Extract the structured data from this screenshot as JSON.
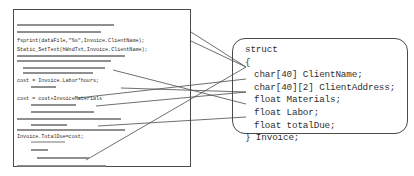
{
  "diagram": {
    "stroke_color": "#4a4a4a",
    "text_color": "#2b2b2b",
    "redaction_color": "#9a9a9a"
  },
  "code_panel": {
    "name": "source-code-listing",
    "legible_lines": [
      {
        "id": "fsprint",
        "text": "fsprint(dataFile,\"%s\",Invoice.ClientName);",
        "x": 3,
        "y": 28
      },
      {
        "id": "static-set",
        "text": "Static_SetText(hWndTxt,Invoice.ClientName);",
        "x": 3,
        "y": 37
      },
      {
        "id": "cost-labor",
        "text": "cost = Invoice.Labor*hours;",
        "x": 3,
        "y": 68
      },
      {
        "id": "cost-matls",
        "text": "cost = cost+InvoiceMaterials",
        "x": 3,
        "y": 86
      },
      {
        "id": "total-due",
        "text": "Invoice.TotalDue=cost;",
        "x": 3,
        "y": 124
      }
    ],
    "redacted_lines": [
      {
        "x": 3,
        "y": 14,
        "w": 97,
        "h": 2,
        "tone": "dark"
      },
      {
        "x": 3,
        "y": 21,
        "w": 84,
        "h": 2,
        "tone": "dark"
      },
      {
        "x": 3,
        "y": 45,
        "w": 108,
        "h": 2,
        "tone": "dark"
      },
      {
        "x": 3,
        "y": 50,
        "w": 94,
        "h": 2,
        "tone": "dark"
      },
      {
        "x": 9,
        "y": 57,
        "w": 82,
        "h": 2,
        "tone": "dark"
      },
      {
        "x": 9,
        "y": 62,
        "w": 70,
        "h": 2,
        "tone": "dark"
      },
      {
        "x": 17,
        "y": 76,
        "w": 25,
        "h": 2,
        "tone": "dark"
      },
      {
        "x": 17,
        "y": 94,
        "w": 45,
        "h": 2,
        "tone": "dark"
      },
      {
        "x": 17,
        "y": 101,
        "w": 63,
        "h": 2,
        "tone": "dark"
      },
      {
        "x": 3,
        "y": 108,
        "w": 104,
        "h": 2,
        "tone": "dark"
      },
      {
        "x": 17,
        "y": 114,
        "w": 36,
        "h": 2,
        "tone": "dark"
      },
      {
        "x": 3,
        "y": 119,
        "w": 108,
        "h": 2,
        "tone": "dark"
      },
      {
        "x": 17,
        "y": 131,
        "w": 34,
        "h": 2,
        "tone": "light"
      },
      {
        "x": 17,
        "y": 139,
        "w": 17,
        "h": 2,
        "tone": "dark"
      },
      {
        "x": 23,
        "y": 147,
        "w": 52,
        "h": 2,
        "tone": "dark"
      },
      {
        "x": 3,
        "y": 155,
        "w": 89,
        "h": 2,
        "tone": "dark"
      }
    ]
  },
  "struct_panel": {
    "name": "struct-definition",
    "lines": [
      {
        "id": "struct-keyword",
        "text": "struct",
        "indent": false
      },
      {
        "id": "open-brace",
        "text": "{",
        "indent": false
      },
      {
        "id": "client-name",
        "text": "char[40] ClientName;",
        "indent": true
      },
      {
        "id": "client-address",
        "text": "char[40][2] ClientAddress;",
        "indent": true
      },
      {
        "id": "materials",
        "text": "float Materials;",
        "indent": true
      },
      {
        "id": "labor",
        "text": "float Labor;",
        "indent": true
      },
      {
        "id": "total-due",
        "text": "float totalDue;",
        "indent": true
      },
      {
        "id": "close-brace",
        "text": "} Invoice;",
        "indent": false
      }
    ]
  },
  "connectors": [
    {
      "id": "fsprint-to-clientname",
      "from_label": "fsprint(dataFile,\"%s\",Invoice.ClientName);",
      "to_label": "char[40] ClientName;",
      "x1": 191,
      "y1": 32,
      "x2": 246,
      "y2": 67
    },
    {
      "id": "staticset-to-clientname",
      "from_label": "Static_SetText(hWndTxt,Invoice.ClientName);",
      "to_label": "char[40] ClientName;",
      "x1": 191,
      "y1": 41,
      "x2": 246,
      "y2": 67
    },
    {
      "id": "costlabor-to-labor",
      "from_label": "cost = Invoice.Labor*hours;",
      "to_label": "float Labor;",
      "x1": 113,
      "y1": 70,
      "x2": 246,
      "y2": 104
    },
    {
      "id": "costmatls-to-materials",
      "from_label": "cost = cost+InvoiceMaterials",
      "to_label": "float Materials;",
      "x1": 121,
      "y1": 88,
      "x2": 246,
      "y2": 92
    },
    {
      "id": "redacted-to-clientaddr",
      "from_label": "redacted source line",
      "to_label": "char[40][2] ClientAddress;",
      "x1": 78,
      "y1": 98,
      "x2": 246,
      "y2": 79
    },
    {
      "id": "redacted2-to-materials",
      "from_label": "redacted source line",
      "to_label": "float Materials;",
      "x1": 96,
      "y1": 106,
      "x2": 246,
      "y2": 92
    },
    {
      "id": "totaldue-to-totaldue",
      "from_label": "Invoice.TotalDue=cost;",
      "to_label": "float totalDue;",
      "x1": 98,
      "y1": 126,
      "x2": 246,
      "y2": 117
    },
    {
      "id": "bottom-to-clientname",
      "from_label": "redacted source line",
      "to_label": "char[40] ClientName;",
      "x1": 86,
      "y1": 160,
      "x2": 246,
      "y2": 67
    }
  ]
}
